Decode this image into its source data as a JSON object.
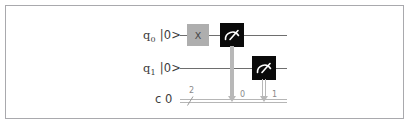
{
  "figure": {
    "kind": "quantum-circuit-diagram",
    "border_color": "#a9a9ad",
    "background": "#ffffff"
  },
  "registers": {
    "quantum": [
      {
        "name": "q",
        "index": "0",
        "state": "|0>",
        "label": "q0 |0>"
      },
      {
        "name": "q",
        "index": "1",
        "state": "|0>",
        "label": "q1 |0>"
      }
    ],
    "classical": {
      "label": "c 0",
      "name": "c",
      "index": "0",
      "width": "2"
    }
  },
  "gates": [
    {
      "id": "x-gate",
      "type": "X",
      "label": "X",
      "wire": "q0",
      "color": "#aeaeae",
      "text_color": "#454545"
    },
    {
      "id": "measure-0",
      "type": "measure",
      "icon": "meter-icon",
      "wire": "q0",
      "target_bit": "0",
      "color": "#0a0a0a"
    },
    {
      "id": "measure-1",
      "type": "measure",
      "icon": "meter-icon",
      "wire": "q1",
      "target_bit": "1",
      "color": "#0a0a0a"
    }
  ],
  "measurement_targets": [
    {
      "index": "0"
    },
    {
      "index": "1"
    }
  ],
  "colors": {
    "wire": "#6e6e6e",
    "classical_wire": "#b6b6b6",
    "connector": "#b8b8b8",
    "gate_x": "#aeaeae",
    "gate_measure": "#0a0a0a"
  }
}
